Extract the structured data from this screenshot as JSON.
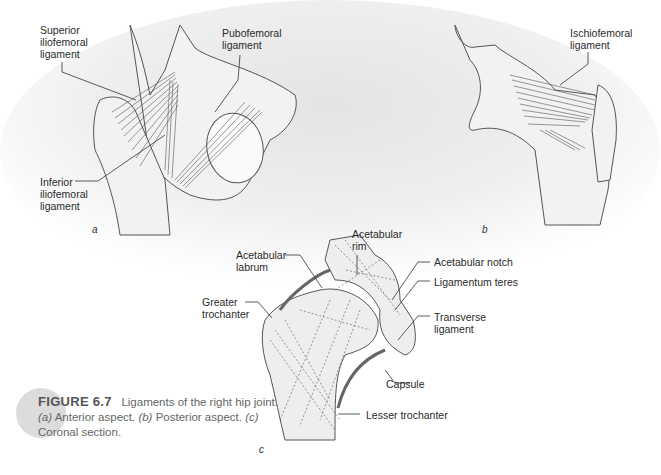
{
  "figure": {
    "number_label": "FIGURE 6.7",
    "caption_lead": "Ligaments of the right hip joint.",
    "parts": [
      {
        "tag": "(a)",
        "text": "Anterior aspect."
      },
      {
        "tag": "(b)",
        "text": "Posterior aspect."
      },
      {
        "tag": "(c)",
        "text": "Coronal section."
      }
    ]
  },
  "panels": {
    "a": {
      "letter": "a",
      "labels": {
        "superior_iliofemoral": "Superior\niliofemoral\nligament",
        "pubofemoral": "Pubofemoral\nligament",
        "inferior_iliofemoral": "Inferior\niliofemoral\nligament"
      }
    },
    "b": {
      "letter": "b",
      "labels": {
        "ischiofemoral": "Ischiofemoral\nligament"
      }
    },
    "c": {
      "letter": "c",
      "labels": {
        "acetabular_rim": "Acetabular\nrim",
        "acetabular_labrum": "Acetabular\nlabrum",
        "greater_trochanter": "Greater\ntrochanter",
        "acetabular_notch": "Acetabular notch",
        "ligamentum_teres": "Ligamentum teres",
        "transverse_ligament": "Transverse\nligament",
        "capsule": "Capsule",
        "lesser_trochanter": "Lesser trochanter"
      }
    }
  },
  "colors": {
    "band_gray": "#e6e6e6",
    "bone_fill": "#f0f0f0",
    "line": "#444444",
    "caption_text": "#666666",
    "caption_dot": "#dcdcdc"
  }
}
